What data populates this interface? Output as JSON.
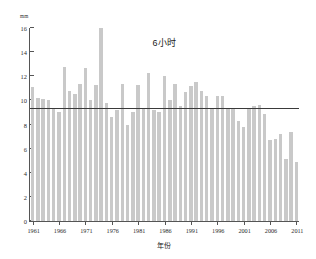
{
  "chart_data": {
    "type": "bar",
    "title": "6小时",
    "xlabel": "年份",
    "ylabel": "mm",
    "ylim": [
      0,
      16
    ],
    "xlim": [
      1961,
      2011
    ],
    "grid": false,
    "legend": null,
    "yticks": [
      0,
      2,
      4,
      6,
      8,
      10,
      12,
      14,
      16
    ],
    "ytick_labels": [
      "0",
      "2",
      "4",
      "6",
      "8",
      "10",
      "12",
      "14",
      "16"
    ],
    "xticks": [
      1961,
      1966,
      1971,
      1976,
      1981,
      1986,
      1991,
      1996,
      2001,
      2006,
      2011
    ],
    "xtick_labels": [
      "1961",
      "1966",
      "1971",
      "1976",
      "1981",
      "1986",
      "1991",
      "1996",
      "2001",
      "2006",
      "2011"
    ],
    "bar_color": "#c9c9c9",
    "categories": [
      "1961",
      "1962",
      "1963",
      "1964",
      "1965",
      "1966",
      "1967",
      "1968",
      "1969",
      "1970",
      "1971",
      "1972",
      "1973",
      "1974",
      "1975",
      "1976",
      "1977",
      "1978",
      "1979",
      "1980",
      "1981",
      "1982",
      "1983",
      "1984",
      "1985",
      "1986",
      "1987",
      "1988",
      "1989",
      "1990",
      "1991",
      "1992",
      "1993",
      "1994",
      "1995",
      "1996",
      "1997",
      "1998",
      "1999",
      "2000",
      "2001",
      "2002",
      "2003",
      "2004",
      "2005",
      "2006",
      "2007",
      "2008",
      "2009",
      "2010",
      "2011"
    ],
    "values": [
      11.1,
      10.2,
      10.1,
      10.0,
      9.3,
      9.0,
      12.8,
      10.8,
      10.5,
      11.4,
      12.7,
      10.0,
      11.3,
      16.0,
      9.8,
      8.6,
      9.2,
      11.4,
      8.0,
      9.0,
      11.3,
      9.3,
      12.3,
      9.2,
      9.0,
      12.0,
      10.0,
      11.4,
      9.5,
      10.7,
      11.2,
      11.5,
      10.8,
      10.4,
      9.3,
      10.4,
      10.4,
      9.3,
      9.3,
      8.3,
      7.8,
      9.4,
      9.5,
      9.6,
      8.9,
      6.7,
      6.8,
      7.2,
      5.1,
      7.4,
      4.9
    ],
    "reference_line": {
      "name": "mean-line",
      "value": 9.3,
      "color": "#3a3a3a"
    }
  }
}
